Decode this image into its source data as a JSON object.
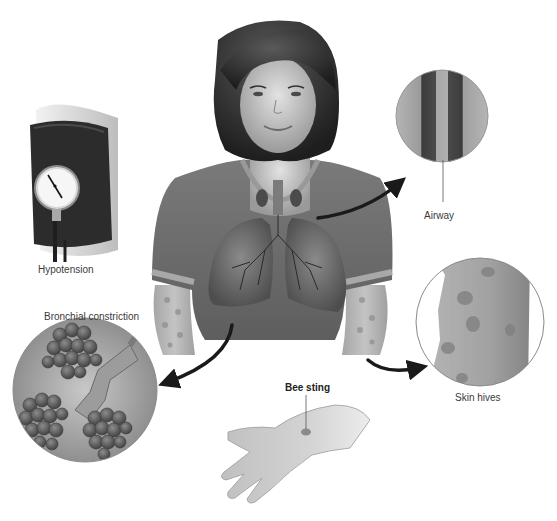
{
  "figure": {
    "type": "anatomical-illustration",
    "labels": {
      "hypotension": "Hypotension",
      "airway": "Airway",
      "bronchial_constriction": "Bronchial constriction",
      "skin_hives": "Skin hives",
      "bee_sting": "Bee sting"
    },
    "icons": {
      "blood_pressure_cuff": "sphygmomanometer-icon",
      "airway_inset": "airway-cross-section-icon",
      "bronchi_inset": "bronchi-alveoli-icon",
      "hives_inset": "skin-hives-icon",
      "hand": "hand-icon"
    },
    "gauge_ticks": [
      "20",
      "40",
      "60",
      "80",
      "100",
      "120",
      "140"
    ],
    "colors": {
      "background": "#ffffff",
      "shirt": "#6e6e6e",
      "skin": "#c9c9c9",
      "hair": "#2e2e2e",
      "arrow": "#1a1a1a",
      "label_text": "#3a3a3a"
    }
  }
}
